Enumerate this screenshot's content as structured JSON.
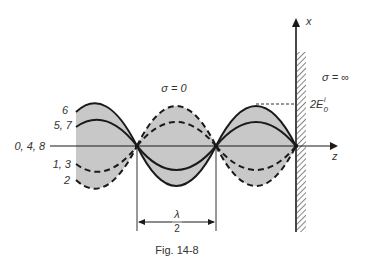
{
  "figure": {
    "caption": "Fig. 14-8",
    "axes": {
      "vertical_label": "x",
      "horizontal_label": "z"
    },
    "regions": {
      "left_medium": "σ = 0",
      "right_medium": "σ = ∞"
    },
    "amplitude_label": {
      "base": "2E",
      "sup": "i",
      "sub": "0"
    },
    "wavelength_label": {
      "numerator": "λ",
      "denominator": "2"
    },
    "curve_labels": {
      "outer_top": "6",
      "inner_top": "5, 7",
      "axis": "0, 4, 8",
      "inner_bottom": "1, 3",
      "outer_bottom": "2"
    },
    "colors": {
      "fill": "#c8c8c8",
      "line": "#1a1a1a",
      "text": "#333333"
    }
  }
}
